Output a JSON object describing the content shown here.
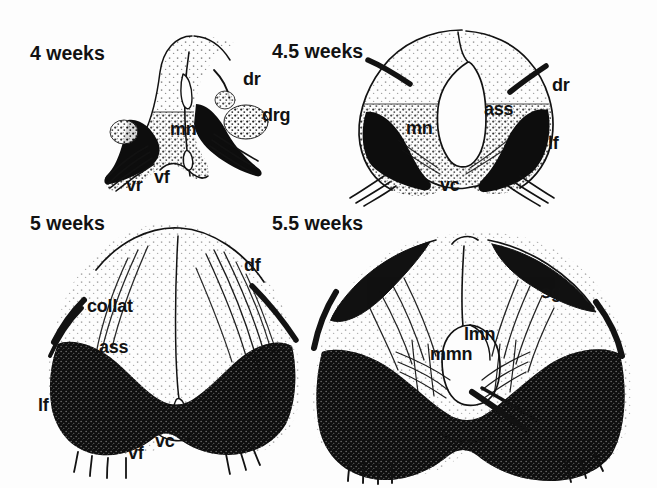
{
  "figure": {
    "background_color": "#fdfdfd",
    "ink_color": "#121212",
    "width": 657,
    "height": 488
  },
  "abbreviation_meanings": {
    "dr": "dorsal root",
    "drg": "dorsal root ganglion",
    "mn": "motor neuron",
    "vr": "ventral root",
    "vf": "ventral funiculus",
    "vc": "ventral commissure",
    "ass": "anterior spinal sulcus",
    "lf": "lateral funiculus",
    "df": "dorsal funiculus",
    "collat": "collateral",
    "sg": "substantia gelatinosa",
    "lmn": "lateral motor neurons",
    "mmn": "medial motor neurons"
  },
  "panels": [
    {
      "id": "panel-4-weeks",
      "stage": "4 weeks",
      "stage_pos": {
        "x": 30,
        "y": 44
      },
      "labels": [
        {
          "name": "label-dr",
          "text": "dr",
          "x": 243,
          "y": 70
        },
        {
          "name": "label-drg",
          "text": "drg",
          "x": 262,
          "y": 106
        },
        {
          "name": "label-mn",
          "text": "mn",
          "x": 170,
          "y": 120
        },
        {
          "name": "label-vr",
          "text": "vr",
          "x": 126,
          "y": 176
        },
        {
          "name": "label-vf",
          "text": "vf",
          "x": 154,
          "y": 168
        }
      ]
    },
    {
      "id": "panel-4-5-weeks",
      "stage": "4.5 weeks",
      "stage_pos": {
        "x": 272,
        "y": 42
      },
      "labels": [
        {
          "name": "label-dr",
          "text": "dr",
          "x": 552,
          "y": 76
        },
        {
          "name": "label-ass",
          "text": "ass",
          "x": 484,
          "y": 100
        },
        {
          "name": "label-mn",
          "text": "mn",
          "x": 406,
          "y": 119
        },
        {
          "name": "label-lf",
          "text": "lf",
          "x": 548,
          "y": 134
        },
        {
          "name": "label-vc",
          "text": "vc",
          "x": 440,
          "y": 176
        }
      ]
    },
    {
      "id": "panel-5-weeks",
      "stage": "5 weeks",
      "stage_pos": {
        "x": 30,
        "y": 214
      },
      "labels": [
        {
          "name": "label-df",
          "text": "df",
          "x": 244,
          "y": 256
        },
        {
          "name": "label-collat",
          "text": "collat",
          "x": 87,
          "y": 297
        },
        {
          "name": "label-ass",
          "text": "ass",
          "x": 99,
          "y": 338
        },
        {
          "name": "label-lf",
          "text": "lf",
          "x": 38,
          "y": 396
        },
        {
          "name": "label-vc",
          "text": "vc",
          "x": 155,
          "y": 432
        },
        {
          "name": "label-vf",
          "text": "vf",
          "x": 128,
          "y": 444
        }
      ]
    },
    {
      "id": "panel-5-5-weeks",
      "stage": "5.5 weeks",
      "stage_pos": {
        "x": 272,
        "y": 214
      },
      "labels": [
        {
          "name": "label-sg",
          "text": "sg",
          "x": 541,
          "y": 283
        },
        {
          "name": "label-lmn",
          "text": "lmn",
          "x": 464,
          "y": 325
        },
        {
          "name": "label-mmn",
          "text": "mmn",
          "x": 430,
          "y": 345
        }
      ]
    }
  ]
}
